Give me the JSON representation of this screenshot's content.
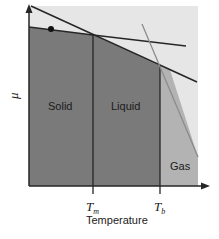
{
  "diagram": {
    "type": "phase-diagram",
    "y_axis_label": "μ",
    "x_axis_label": "Temperature",
    "regions": [
      {
        "label": "Solid"
      },
      {
        "label": "Liquid"
      },
      {
        "label": "Gas"
      }
    ],
    "ticks": {
      "tm": {
        "main": "T",
        "sub": "m"
      },
      "tb": {
        "main": "T",
        "sub": "b"
      }
    },
    "colors": {
      "background_panel": "#e6e6e6",
      "solid_liquid_fill": "#7a7a7a",
      "gas_fill": "#b3b3b3",
      "line": "#262626",
      "gas_line": "#8c8c8c"
    }
  }
}
